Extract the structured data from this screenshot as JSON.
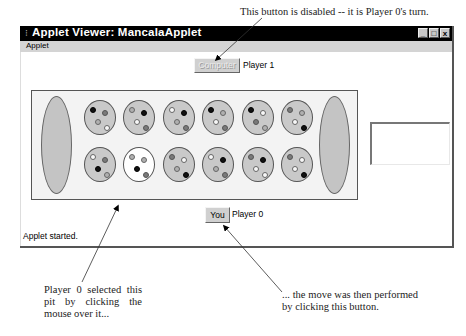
{
  "annotations": {
    "top": "This button is disabled -- it is Player 0's turn.",
    "left": "Player 0 selected this pit by clicking the mouse over it...",
    "right": "... the move was then performed by clicking this button."
  },
  "window": {
    "title": "Applet Viewer: MancalaApplet",
    "controls": {
      "minimize": "_",
      "maximize": "□",
      "close": "x"
    },
    "menu": [
      "Applet"
    ]
  },
  "player1": {
    "button_label": "Computer",
    "button_enabled": false,
    "label": "Player 1"
  },
  "player0": {
    "button_label": "You",
    "button_enabled": true,
    "label": "Player 0"
  },
  "status": "Applet started.",
  "board": {
    "colors": {
      "pit": "#c9c9c9",
      "selected_pit": "#ffffff",
      "board_bg": "#f3f3f3"
    },
    "stores": {
      "left": 0,
      "right": 0
    },
    "top_row": [
      {
        "stones": [
          "black",
          "gray",
          "light",
          "white"
        ]
      },
      {
        "stones": [
          "light",
          "black",
          "white",
          "gray"
        ]
      },
      {
        "stones": [
          "white",
          "black",
          "light",
          "gray"
        ]
      },
      {
        "stones": [
          "black",
          "light",
          "white",
          "gray"
        ]
      },
      {
        "stones": [
          "black",
          "white",
          "gray",
          "light"
        ]
      },
      {
        "stones": [
          "gray",
          "light",
          "white",
          "black"
        ]
      }
    ],
    "bottom_row": [
      {
        "stones": [
          "white",
          "gray",
          "black",
          "light"
        ]
      },
      {
        "stones": [
          "light",
          "light",
          "black",
          "gray"
        ],
        "selected": true
      },
      {
        "stones": [
          "gray",
          "white",
          "light",
          "black"
        ]
      },
      {
        "stones": [
          "white",
          "black",
          "light",
          "gray"
        ]
      },
      {
        "stones": [
          "gray",
          "black",
          "white",
          "white"
        ]
      },
      {
        "stones": [
          "gray",
          "white",
          "white",
          "black"
        ]
      }
    ]
  }
}
